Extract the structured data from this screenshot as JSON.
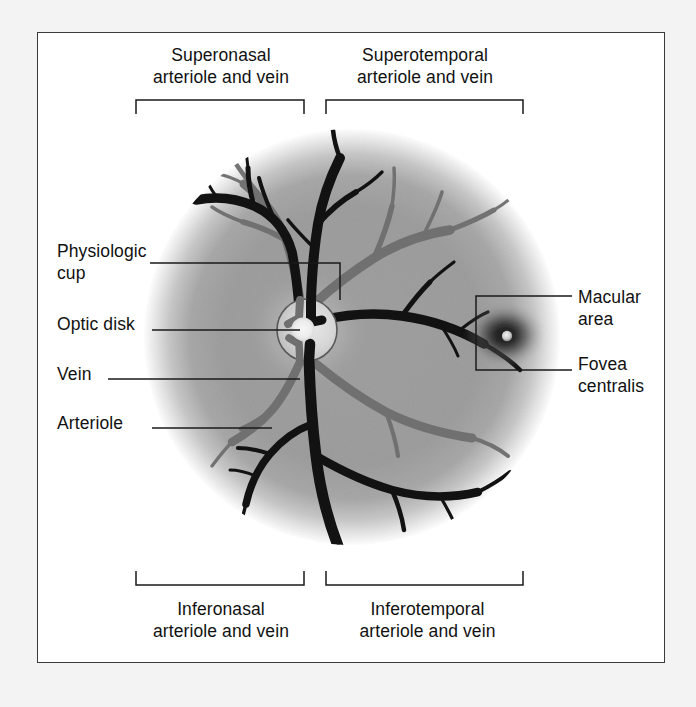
{
  "figure": {
    "type": "anatomical-diagram",
    "frame_border_color": "#3a3a3a",
    "background_color": "#f3f3f3",
    "plate_color": "#ffffff"
  },
  "labels": {
    "superonasal": "Superonasal\narteriole and vein",
    "superotemporal": "Superotemporal\narteriole and vein",
    "inferonasal": "Inferonasal\narteriole and vein",
    "inferotemporal": "Inferotemporal\narteriole and vein",
    "physiologic_cup": "Physiologic\ncup",
    "optic_disk": "Optic disk",
    "vein": "Vein",
    "arteriole": "Arteriole",
    "macular_area": "Macular\narea",
    "fovea_centralis": "Fovea\ncentralis"
  },
  "structures": {
    "fundus": {
      "name": "retinal fundus",
      "center": [
        352,
        337
      ],
      "radius": 208,
      "fill_color": "#9a9a9a"
    },
    "optic_disk": {
      "name": "optic disk",
      "center": [
        307,
        330
      ],
      "radius_x": 30,
      "radius_y": 31,
      "fill_color": "#d8d8d8"
    },
    "physiologic_cup": {
      "name": "physiologic cup",
      "center": [
        303,
        328
      ],
      "radius": 12,
      "fill_color": "#f0f0f0"
    },
    "macula": {
      "name": "macular area",
      "center": [
        505,
        335
      ],
      "radius": 36,
      "fill_color": "#1a1a1a"
    },
    "fovea": {
      "name": "fovea centralis",
      "center": [
        507,
        336
      ],
      "radius": 5,
      "fill_color": "#e8e8e8"
    },
    "vessel_colors": {
      "vein": "#141414",
      "arteriole": "#6e6e6e"
    }
  },
  "leaders": {
    "brackets": [
      {
        "name": "superonasal-bracket",
        "x1": 136,
        "x2": 304,
        "y": 100,
        "tick": "down"
      },
      {
        "name": "superotemporal-bracket",
        "x1": 326,
        "x2": 523,
        "y": 100,
        "tick": "down"
      },
      {
        "name": "inferonasal-bracket",
        "x1": 136,
        "x2": 304,
        "y": 585,
        "tick": "up"
      },
      {
        "name": "inferotemporal-bracket",
        "x1": 326,
        "x2": 523,
        "y": 585,
        "tick": "up"
      }
    ],
    "lines": [
      {
        "name": "physiologic-cup-leader",
        "path": "M150 263 L340 263 L340 300"
      },
      {
        "name": "optic-disk-leader",
        "path": "M152 330 L300 330"
      },
      {
        "name": "vein-leader",
        "path": "M108 379 L300 379"
      },
      {
        "name": "arteriole-leader",
        "path": "M152 428 L272 428"
      },
      {
        "name": "macular-leader",
        "path": "M572 296 L476 296 L476 370 L572 370"
      }
    ]
  }
}
